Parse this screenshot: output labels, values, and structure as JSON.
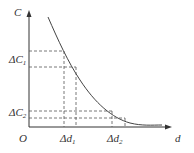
{
  "diagram": {
    "type": "function-curve",
    "axes": {
      "y_label": "C",
      "x_label": "d",
      "origin_label": "O"
    },
    "y_markers": [
      {
        "label": "ΔC",
        "subscript": "1"
      },
      {
        "label": "ΔC",
        "subscript": "2"
      }
    ],
    "x_markers": [
      {
        "label": "Δd",
        "subscript": "1"
      },
      {
        "label": "Δd",
        "subscript": "2"
      }
    ],
    "curve": "decreasing convex curve approaching the d-axis",
    "colors": {
      "axis": "#333333",
      "curve": "#444444",
      "dashed": "#555555"
    }
  }
}
